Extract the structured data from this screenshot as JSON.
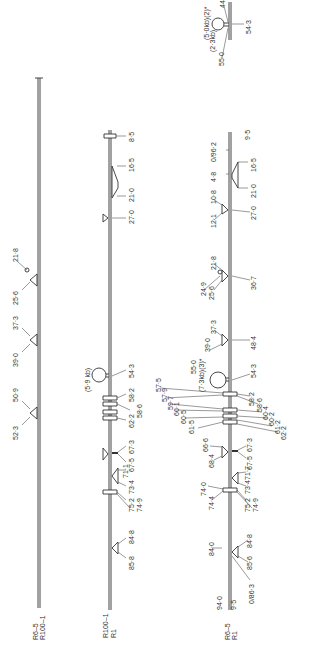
{
  "diagram": {
    "type": "heteroduplex-map",
    "orientation": "rotated-90",
    "colors": {
      "line": "#444444",
      "text": "#333333",
      "background": "#ffffff"
    },
    "strands": [
      {
        "id": "left",
        "end_label_1": "R6–5",
        "end_label_2": "R100–1",
        "features": [
          {
            "kind": "loop",
            "labels": [
              "21·8",
              "25·6"
            ]
          },
          {
            "kind": "triangle",
            "labels": [
              "37·3",
              "39·0"
            ]
          },
          {
            "kind": "triangle",
            "labels": [
              "50·9",
              "52·3"
            ]
          }
        ]
      },
      {
        "id": "middle",
        "end_label_1": "R100–1",
        "end_label_2": "R1",
        "size_label": "(5·9 kb)",
        "labels": [
          "8·5",
          "16·5",
          "21·0",
          "27·0",
          "54·3",
          "58·2",
          "58·6",
          "62·2",
          "67·3",
          "67·5",
          "71·1",
          "73·4",
          "75·2",
          "74·9",
          "84·8",
          "85·8"
        ]
      },
      {
        "id": "right",
        "end_label_1": "R6–5",
        "end_label_2": "R1",
        "size_label": "(7·3kb)(3)*",
        "left_labels": [
          "0/96·2",
          "4·8",
          "10·8",
          "12·1",
          "21·8",
          "24·9",
          "25·6",
          "37·3",
          "39·0",
          "55·0",
          "57·5",
          "57·9",
          "59·7",
          "60·1",
          "60·5",
          "61·5",
          "66·6",
          "68·4",
          "74·0",
          "74·4",
          "84·0",
          "94·0"
        ],
        "right_labels": [
          "9·5",
          "16·5",
          "21·0",
          "27·0",
          "36·7",
          "48·4",
          "54·3",
          "58·2",
          "58·6",
          "60·4",
          "60·2",
          "61·2",
          "62·2",
          "67·3",
          "67·5",
          "71·7",
          "73·4",
          "75·2",
          "74·9",
          "84·8",
          "85·6",
          "0/86·3",
          "9·5"
        ]
      }
    ],
    "inset": {
      "labels": [
        "(5·0kb)(2)*",
        "(2·3kb)",
        "55·0",
        "44",
        "54·3"
      ]
    }
  }
}
